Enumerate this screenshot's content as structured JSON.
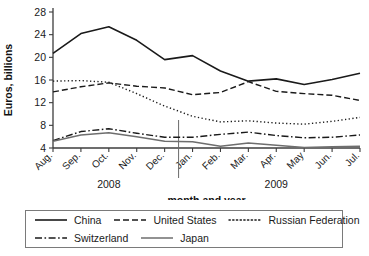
{
  "chart_data": {
    "type": "line",
    "title": "",
    "xlabel": "month and year",
    "ylabel": "Euros, billions",
    "ylim": [
      4,
      28
    ],
    "yticks": [
      4,
      8,
      12,
      16,
      20,
      24,
      28
    ],
    "grid": false,
    "legend_position": "bottom",
    "categories": [
      "Aug.",
      "Sep.",
      "Oct.",
      "Nov.",
      "Dec.",
      "Jan.",
      "Feb.",
      "Mar.",
      "Apr.",
      "May",
      "Jun.",
      "Jul."
    ],
    "year_groups": [
      {
        "label": "2008",
        "start": 0,
        "end": 4
      },
      {
        "label": "2009",
        "start": 5,
        "end": 11
      }
    ],
    "series": [
      {
        "name": "China",
        "style": "solid",
        "color": "#1a1a1a",
        "width": 1.6,
        "values": [
          20.7,
          24.2,
          25.4,
          23.0,
          19.6,
          20.3,
          17.6,
          15.8,
          16.2,
          15.2,
          16.1,
          17.2
        ]
      },
      {
        "name": "United States",
        "style": "dashed",
        "color": "#1a1a1a",
        "width": 1.4,
        "values": [
          13.9,
          14.8,
          15.5,
          14.9,
          14.6,
          13.4,
          13.8,
          15.7,
          14.0,
          13.6,
          13.3,
          12.4
        ]
      },
      {
        "name": "Russian Federation",
        "style": "dotted",
        "color": "#1a1a1a",
        "width": 1.4,
        "values": [
          15.8,
          15.9,
          15.6,
          13.6,
          11.4,
          9.6,
          8.6,
          8.8,
          8.4,
          8.2,
          8.7,
          9.4
        ]
      },
      {
        "name": "Switzerland",
        "style": "dashdot",
        "color": "#1a1a1a",
        "width": 1.4,
        "values": [
          5.3,
          6.9,
          7.4,
          6.6,
          5.9,
          5.9,
          6.4,
          6.8,
          6.2,
          5.8,
          5.9,
          6.3
        ]
      },
      {
        "name": "Japan",
        "style": "solid-light",
        "color": "#6e6e6e",
        "width": 1.5,
        "values": [
          5.2,
          6.3,
          6.7,
          6.0,
          5.2,
          5.1,
          4.3,
          4.9,
          4.5,
          4.1,
          4.2,
          4.3
        ]
      }
    ]
  },
  "legend": {
    "rows": [
      [
        "China",
        "United States",
        "Russian Federation"
      ],
      [
        "Switzerland",
        "Japan"
      ]
    ]
  }
}
